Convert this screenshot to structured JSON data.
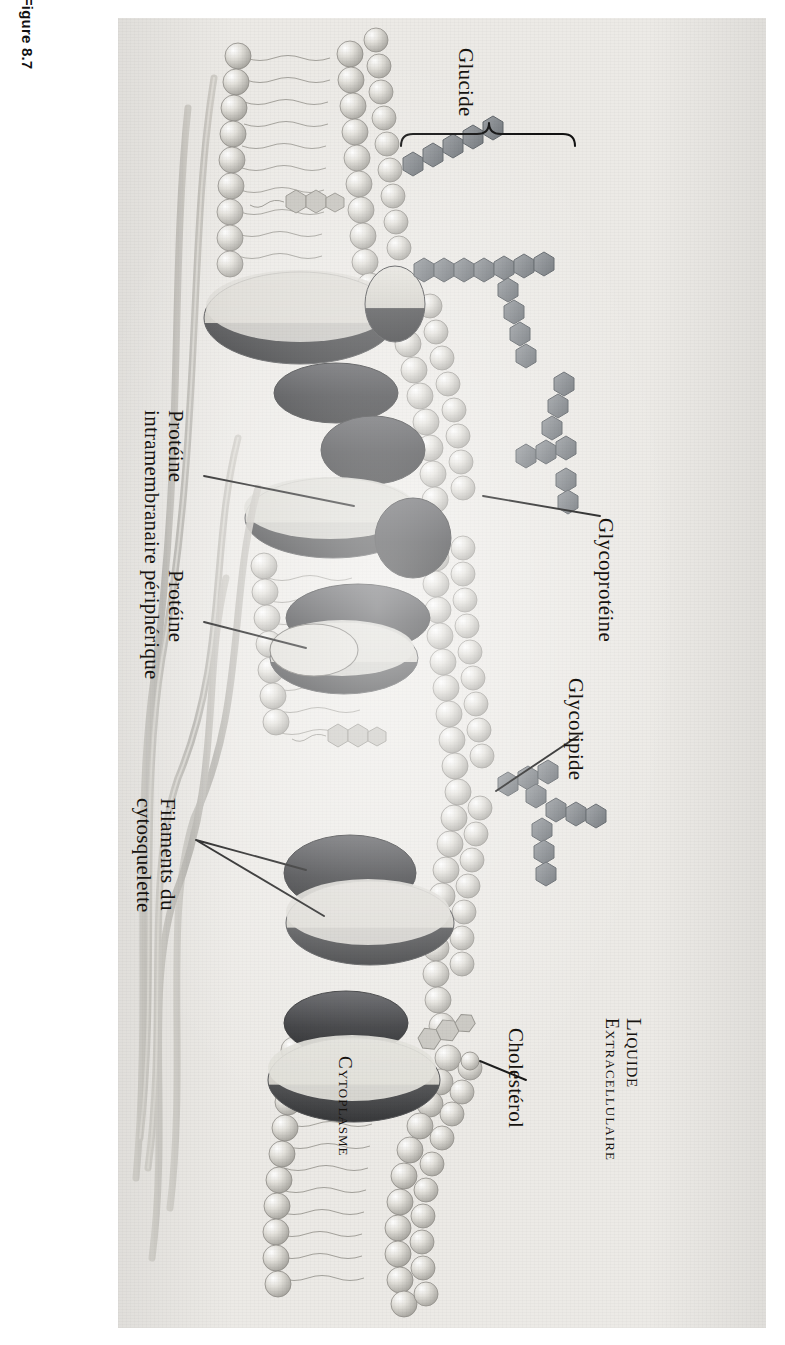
{
  "figure": {
    "number": "Figure 8.7"
  },
  "diagram": {
    "type": "labeled-biological-illustration",
    "orientation": "rotated-90-clockwise"
  },
  "labels": {
    "glucide": "Glucide",
    "glycoproteine": "Glycoprotéine",
    "glycolipide": "Glycolipide",
    "proteine_intramembranaire_l1": "Protéine",
    "proteine_intramembranaire_l2": "intramembranaire",
    "proteine_peripherique_l1": "Protéine",
    "proteine_peripherique_l2": "périphérique",
    "filaments_l1": "Filaments du",
    "filaments_l2": "cytosquelette",
    "cholesterol": "Cholestérol",
    "liquide_extracellulaire_l1": "Liquide",
    "liquide_extracellulaire_l2": "Extracellulaire",
    "cytoplasme": "Cytoplasme"
  },
  "colors": {
    "paper": "#eceae6",
    "ink": "#16130f",
    "carbohydrate": "#8a8f93",
    "carbohydrate_dark": "#6f7479",
    "protein_light": "#d9d7d1",
    "protein_dark": "#3a3b3d",
    "lipid_head": "#cfcdc7",
    "filament": "#b9b7b1"
  }
}
